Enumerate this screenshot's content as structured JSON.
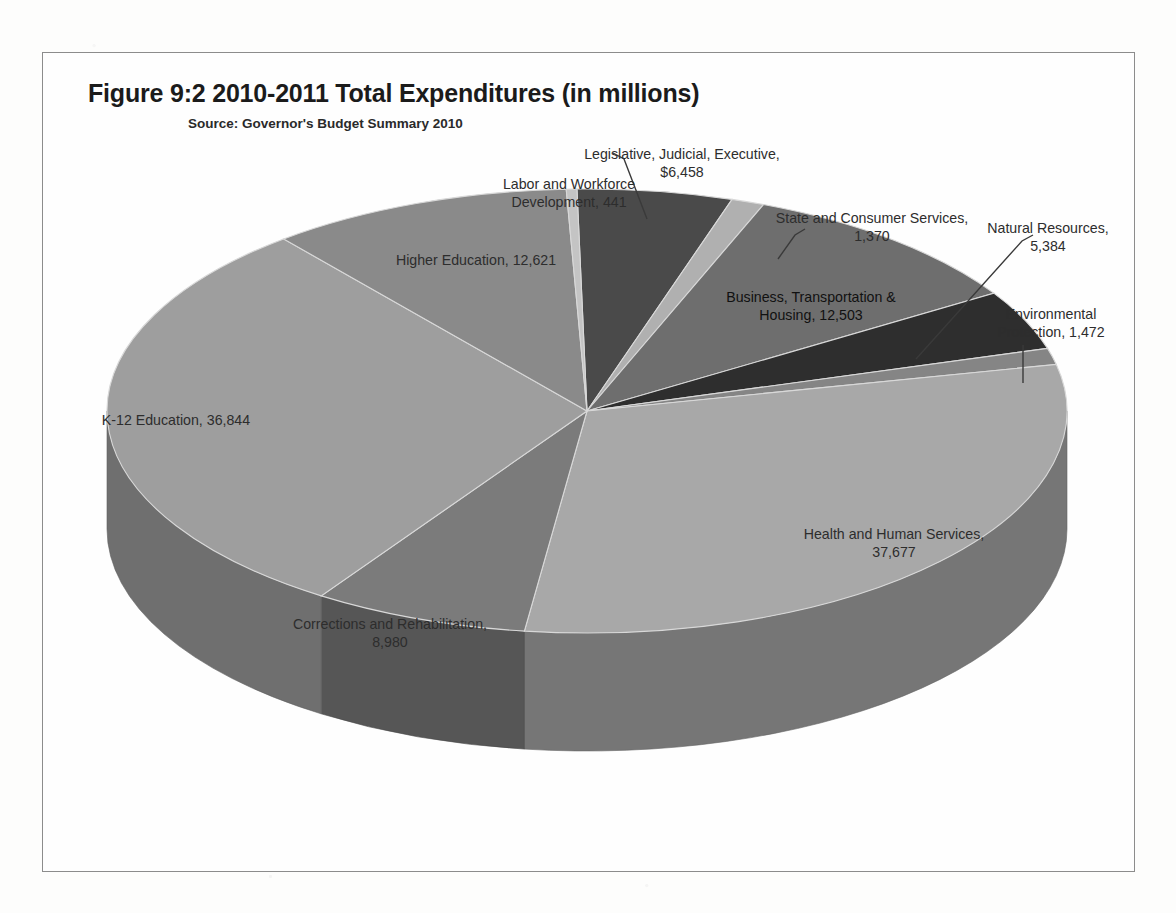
{
  "figure": {
    "title": "Figure 9:2 2010-2011 Total Expenditures (in millions)",
    "source": "Source: Governor's Budget Summary 2010"
  },
  "chart_data": {
    "type": "pie",
    "title": "Figure 9:2 2010-2011 Total Expenditures (in millions)",
    "subtitle": "Source: Governor's Budget Summary 2010",
    "units": "millions of dollars",
    "total": 123750,
    "legend": "none",
    "three_d": true,
    "categories": [
      "Legislative, Judicial, Executive",
      "State and Consumer Services",
      "Business, Transportation & Housing",
      "Natural Resources",
      "Environmental Protection",
      "Health and Human Services",
      "Corrections and Rehabilitation",
      "K-12 Education",
      "Higher Education",
      "Labor and Workforce Development"
    ],
    "values": [
      6458,
      1370,
      12503,
      5384,
      1472,
      37677,
      8980,
      36844,
      12621,
      441
    ],
    "slices": [
      {
        "name": "Legislative, Judicial, Executive",
        "value": 6458,
        "label": "Legislative, Judicial, Executive,\n$6,458",
        "color": "#4a4a4a"
      },
      {
        "name": "State and Consumer Services",
        "value": 1370,
        "label": "State and Consumer Services,\n1,370",
        "color": "#b0b0b0"
      },
      {
        "name": "Business, Transportation & Housing",
        "value": 12503,
        "label": "Business, Transportation &\nHousing, 12,503",
        "color": "#6e6e6e"
      },
      {
        "name": "Natural Resources",
        "value": 5384,
        "label": "Natural Resources,\n5,384",
        "color": "#2e2e2e"
      },
      {
        "name": "Environmental Protection",
        "value": 1472,
        "label": "Environmental\nProtection, 1,472",
        "color": "#858585"
      },
      {
        "name": "Health and Human Services",
        "value": 37677,
        "label": "Health and Human Services,\n37,677",
        "color": "#a8a8a8"
      },
      {
        "name": "Corrections and Rehabilitation",
        "value": 8980,
        "label": "Corrections and Rehabilitation,\n8,980",
        "color": "#7b7b7b"
      },
      {
        "name": "K-12 Education",
        "value": 36844,
        "label": "K-12 Education, 36,844",
        "color": "#9e9e9e"
      },
      {
        "name": "Higher Education",
        "value": 12621,
        "label": "Higher Education, 12,621",
        "color": "#8a8a8a"
      },
      {
        "name": "Labor and Workforce Development",
        "value": 441,
        "label": "Labor and Workforce\nDevelopment, 441",
        "color": "#c4c4c4"
      }
    ],
    "colors": {
      "frame_border": "#8c8c8c",
      "background": "#fefefe",
      "label_text": "#2d2d2d",
      "leader_line": "#3a3a3a"
    }
  }
}
